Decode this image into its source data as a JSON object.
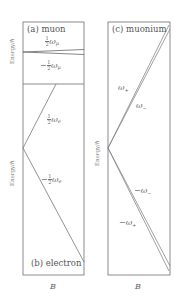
{
  "figure": {
    "panels": [
      {
        "id": "a",
        "title": "(a) muon",
        "ylabel": "Energy/ℏ",
        "levels": [
          {
            "label_sign": "",
            "label_coef": "1/2",
            "label_symbol": "ω",
            "label_sub": "μ"
          },
          {
            "label_sign": "−",
            "label_coef": "1/2",
            "label_symbol": "ω",
            "label_sub": "μ"
          }
        ]
      },
      {
        "id": "b",
        "title": "(b) electron",
        "ylabel": "Energy/ℏ",
        "xlabel": "B",
        "levels": [
          {
            "label_sign": "",
            "label_coef": "1/2",
            "label_symbol": "ω",
            "label_sub": "e"
          },
          {
            "label_sign": "−",
            "label_coef": "1/2",
            "label_symbol": "ω",
            "label_sub": "e"
          }
        ]
      },
      {
        "id": "c",
        "title": "(c) muonium",
        "ylabel": "Energy/ℏ",
        "xlabel": "B",
        "levels": [
          {
            "label": "ω+",
            "symbol": "ω",
            "sub": "+",
            "sign": ""
          },
          {
            "label": "ω−",
            "symbol": "ω",
            "sub": "−",
            "sign": ""
          },
          {
            "label": "−ω−",
            "symbol": "ω",
            "sub": "−",
            "sign": "−"
          },
          {
            "label": "−ω+",
            "symbol": "ω",
            "sub": "+",
            "sign": "−"
          }
        ]
      }
    ],
    "colors": {
      "frame": "#6e6e6e",
      "line": "#777777",
      "text": "#555555"
    }
  },
  "num_one": "1",
  "den_two": "2"
}
